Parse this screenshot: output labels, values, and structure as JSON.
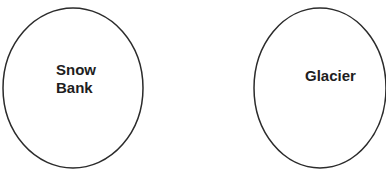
{
  "diagram": {
    "nodes": [
      {
        "id": "snow-bank",
        "label_line1": "Snow",
        "label_line2": "Bank"
      },
      {
        "id": "glacier",
        "label": "Glacier"
      }
    ],
    "stroke_color": "#2b2b2b",
    "text_color": "#1e1e1e"
  }
}
